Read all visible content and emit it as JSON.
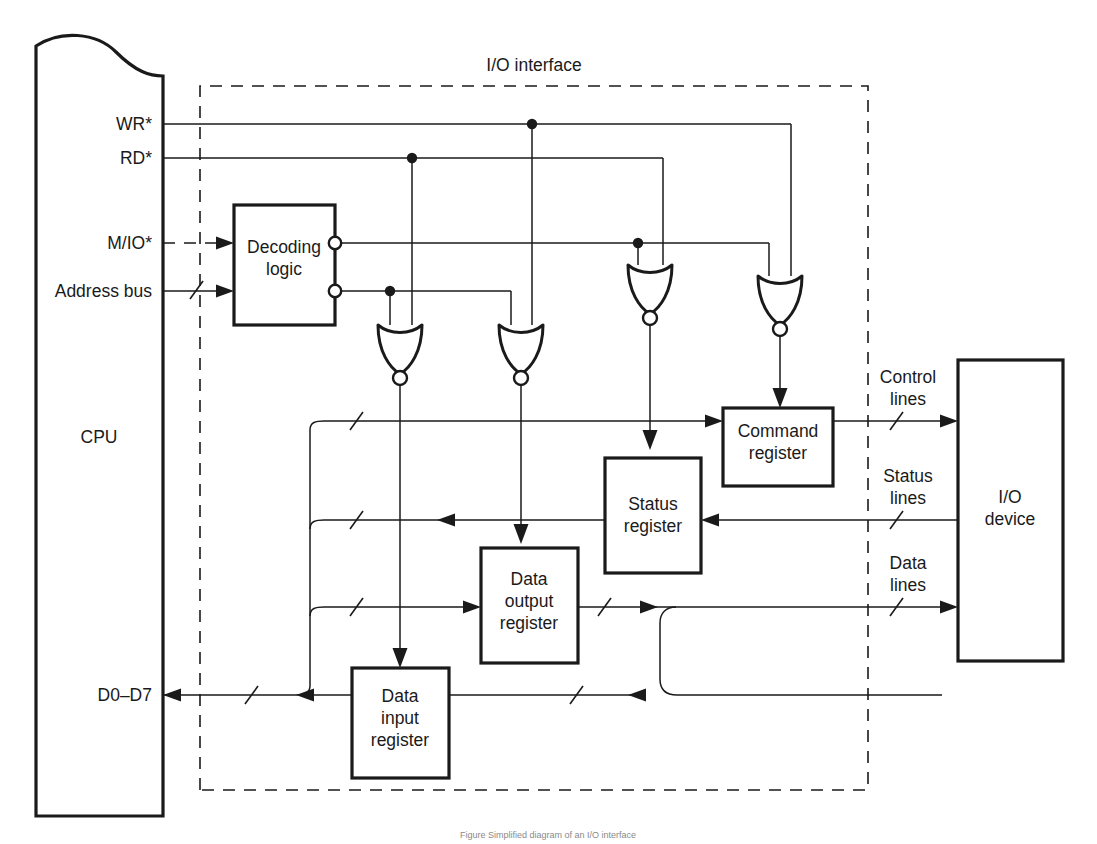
{
  "figure": {
    "title": "I/O interface",
    "caption": "Figure  Simplified diagram of an I/O interface",
    "ink_color": "#1a1a1a",
    "background": "#ffffff"
  },
  "blocks": {
    "cpu": {
      "label": "CPU"
    },
    "decoding_logic": {
      "label_line1": "Decoding",
      "label_line2": "logic"
    },
    "command_register": {
      "label_line1": "Command",
      "label_line2": "register"
    },
    "status_register": {
      "label_line1": "Status",
      "label_line2": "register"
    },
    "data_output_register": {
      "label_line1": "Data",
      "label_line2": "output",
      "label_line3": "register"
    },
    "data_input_register": {
      "label_line1": "Data",
      "label_line2": "input",
      "label_line3": "register"
    },
    "io_device": {
      "label_line1": "I/O",
      "label_line2": "device"
    }
  },
  "cpu_pins": [
    {
      "name": "wr",
      "label": "WR*"
    },
    {
      "name": "rd",
      "label": "RD*"
    },
    {
      "name": "mio",
      "label": "M/IO*"
    },
    {
      "name": "address_bus",
      "label": "Address bus"
    },
    {
      "name": "data_bus",
      "label": "D0–D7"
    }
  ],
  "device_lines": [
    {
      "name": "control",
      "label_line1": "Control",
      "label_line2": "lines"
    },
    {
      "name": "status",
      "label_line1": "Status",
      "label_line2": "lines"
    },
    {
      "name": "data",
      "label_line1": "Data",
      "label_line2": "lines"
    }
  ],
  "gates": [
    {
      "name": "nor-gate-data-input",
      "type": "NOR"
    },
    {
      "name": "nor-gate-data-output",
      "type": "NOR"
    },
    {
      "name": "nor-gate-status",
      "type": "NOR"
    },
    {
      "name": "nor-gate-command",
      "type": "NOR"
    }
  ]
}
